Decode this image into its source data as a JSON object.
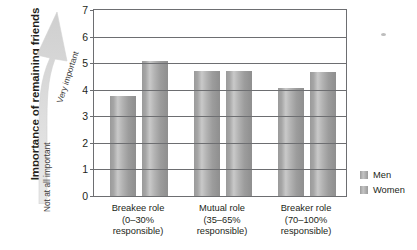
{
  "chart_data": {
    "type": "bar",
    "title": "",
    "xlabel": "",
    "ylabel": "Importance of remaining friends",
    "ylim": [
      0,
      7
    ],
    "yticks": [
      0,
      1,
      2,
      3,
      4,
      5,
      6,
      7
    ],
    "grid": true,
    "legend_position": "right",
    "categories": [
      "Breakee role\n(0–30%\nresponsible)",
      "Mutual role\n(35–65%\nresponsible)",
      "Breaker role\n(70–100%\nresponsible)"
    ],
    "series": [
      {
        "name": "Men",
        "values": [
          3.75,
          4.7,
          4.05
        ],
        "color": "#9e9e9e"
      },
      {
        "name": "Women",
        "values": [
          5.1,
          4.7,
          4.65
        ],
        "color": "#9e9e9e"
      }
    ],
    "annotations": {
      "scale_low": "Not at all important",
      "scale_high": "Very important"
    }
  },
  "axis": {
    "y_title": "Importance of remaining friends",
    "tick_labels": [
      "7",
      "6",
      "5",
      "4",
      "3",
      "2",
      "1",
      "0"
    ]
  },
  "arrow": {
    "top_label": "Very important",
    "bottom_label": "Not at all important"
  },
  "categories": [
    {
      "line1": "Breakee role",
      "line2": "(0–30%",
      "line3": "responsible)"
    },
    {
      "line1": "Mutual role",
      "line2": "(35–65%",
      "line3": "responsible)"
    },
    {
      "line1": "Breaker role",
      "line2": "(70–100%",
      "line3": "responsible)"
    }
  ],
  "legend": {
    "items": [
      {
        "label": "Men"
      },
      {
        "label": "Women"
      }
    ]
  }
}
